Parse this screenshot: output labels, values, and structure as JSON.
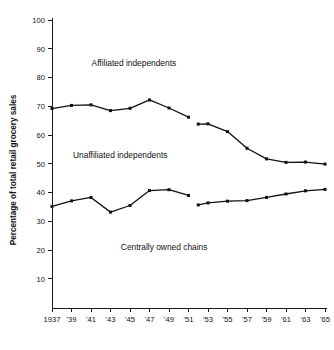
{
  "chart_data": {
    "type": "line",
    "title": "",
    "xlabel": "",
    "ylabel": "Percentage of total retail grocery sales",
    "ylim": [
      0,
      100
    ],
    "ytick_values": [
      10,
      20,
      30,
      40,
      50,
      60,
      70,
      80,
      90,
      100
    ],
    "ytick_labels": [
      "10",
      "20",
      "30",
      "40",
      "50",
      "60",
      "70",
      "80",
      "90",
      "100"
    ],
    "grid": false,
    "legend_position": "in-plot annotations",
    "x": [
      1937,
      1938,
      1939,
      1940,
      1941,
      1942,
      1943,
      1944,
      1945,
      1946,
      1947,
      1948,
      1949,
      1950,
      1951,
      1952,
      1953,
      1954,
      1955,
      1956,
      1957,
      1958,
      1959,
      1960,
      1961,
      1962,
      1963,
      1964,
      1965
    ],
    "xtick_values": [
      1937,
      1939,
      1941,
      1943,
      1945,
      1947,
      1949,
      1951,
      1953,
      1955,
      1957,
      1959,
      1961,
      1963,
      1965
    ],
    "xtick_labels": [
      "1937",
      "'39",
      "'41",
      "'43",
      "'45",
      "'47",
      "'49",
      "'51",
      "'53",
      "'55",
      "'57",
      "'59",
      "'61",
      "'63",
      "'65"
    ],
    "series": [
      {
        "name": "Affiliated independents",
        "label_text": "Affiliated independents",
        "label_x": 1945.4,
        "label_y": 84.0,
        "segments": [
          {
            "x": [
              1937,
              1939,
              1941,
              1943,
              1945,
              1947,
              1949,
              1951
            ],
            "values": [
              69.2,
              70.3,
              70.5,
              68.5,
              69.3,
              72.2,
              69.4,
              66.2
            ]
          },
          {
            "x": [
              1952,
              1953,
              1955,
              1957,
              1959,
              1961,
              1963,
              1965
            ],
            "values": [
              63.8,
              63.9,
              61.2,
              55.4,
              51.7,
              50.5,
              50.6,
              49.9
            ]
          }
        ]
      },
      {
        "name": "Centrally owned chains",
        "label_text": "Centrally owned chains",
        "label_x": 1948.5,
        "label_y": 20.2,
        "segments": [
          {
            "x": [
              1937,
              1939,
              1941,
              1943,
              1945,
              1947,
              1949,
              1951
            ],
            "values": [
              35.2,
              37.1,
              38.3,
              33.2,
              35.5,
              40.7,
              41.0,
              39.0
            ]
          },
          {
            "x": [
              1952,
              1953,
              1955,
              1957,
              1959,
              1961,
              1963,
              1965
            ],
            "values": [
              35.7,
              36.4,
              37.0,
              37.2,
              38.3,
              39.5,
              40.6,
              41.1
            ]
          }
        ]
      }
    ],
    "band_annotations": [
      {
        "text": "Unaffiliated independents",
        "x": 1944.0,
        "y": 52.0
      }
    ],
    "colors": {
      "line": "#111111",
      "axis": "#1a1a1a",
      "background": "#ffffff"
    }
  }
}
